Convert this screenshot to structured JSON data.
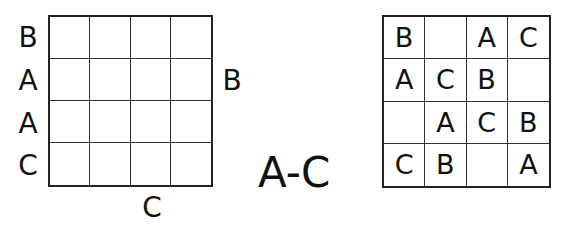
{
  "puzzle": {
    "title": "A-C",
    "left_clues": [
      "B",
      "A",
      "A",
      "C"
    ],
    "right_clues": [
      "",
      "B",
      "",
      ""
    ],
    "top_clues": [
      "",
      "",
      "",
      ""
    ],
    "bottom_clues": [
      "",
      "",
      "C",
      ""
    ],
    "grid": [
      [
        "",
        "",
        "",
        ""
      ],
      [
        "",
        "",
        "",
        ""
      ],
      [
        "",
        "",
        "",
        ""
      ],
      [
        "",
        "",
        "",
        ""
      ]
    ]
  },
  "solution": {
    "grid": [
      [
        "B",
        "",
        "A",
        "C"
      ],
      [
        "A",
        "C",
        "B",
        ""
      ],
      [
        "",
        "A",
        "C",
        "B"
      ],
      [
        "C",
        "B",
        "",
        "A"
      ]
    ]
  }
}
